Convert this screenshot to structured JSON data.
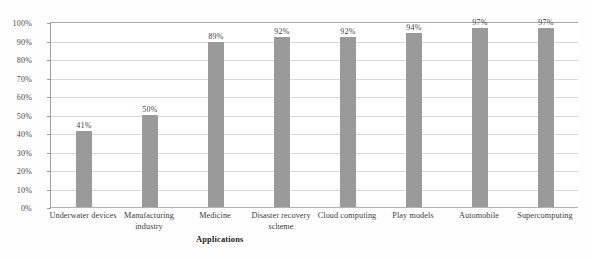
{
  "chart_data": {
    "type": "bar",
    "title": "",
    "subtitle": "",
    "xlabel": "Applications",
    "ylabel": "",
    "categories": [
      "Underwater devices",
      "Manufacturing industry",
      "Medicine",
      "Disaster recovery scheme",
      "Cloud computing",
      "Play models",
      "Automobile",
      "Supercomputing"
    ],
    "values": [
      41,
      50,
      89,
      92,
      92,
      94,
      97,
      97
    ],
    "data_labels": [
      "41%",
      "50%",
      "89%",
      "92%",
      "92%",
      "94%",
      "97%",
      "97%"
    ],
    "ylim": [
      0,
      100
    ],
    "ytick_values": [
      0,
      10,
      20,
      30,
      40,
      50,
      60,
      70,
      80,
      90,
      100
    ],
    "ytick_labels": [
      "0%",
      "10%",
      "20%",
      "30%",
      "40%",
      "50%",
      "60%",
      "70%",
      "80%",
      "90%",
      "100%"
    ],
    "grid": true,
    "grid_axis": "y",
    "legend": false,
    "legend_position": "none",
    "series": [
      {
        "name": "",
        "values": [
          41,
          50,
          89,
          92,
          92,
          94,
          97,
          97
        ]
      }
    ],
    "colors": {
      "bar_fill": "#9a9a9a",
      "gridline": "#d9d9d9",
      "axis": "#a0a0a0",
      "text": "#3b3b3b",
      "background": "#ffffff"
    }
  }
}
